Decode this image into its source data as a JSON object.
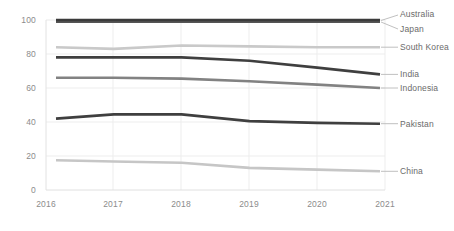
{
  "chart_data": {
    "type": "line",
    "title": "",
    "subtitle": "",
    "xlabel": "",
    "ylabel": "",
    "x": [
      2016,
      2017,
      2018,
      2019,
      2020,
      2021
    ],
    "xtick_labels": [
      "2016",
      "2017",
      "2018",
      "2019",
      "2020",
      "2021"
    ],
    "ytick_labels": [
      "0",
      "20",
      "40",
      "60",
      "80",
      "100"
    ],
    "yticks": [
      0,
      20,
      40,
      60,
      80,
      100
    ],
    "ylim": [
      0,
      100
    ],
    "xlim": [
      2016,
      2021
    ],
    "grid": true,
    "grid_color": "#e8e8e8",
    "legend_position": "right-inline-labels",
    "series": [
      {
        "name": "Australia",
        "values": [
          100,
          100,
          100,
          100,
          100,
          100
        ],
        "color": "#3b3b3b",
        "label": "Australia"
      },
      {
        "name": "Japan",
        "values": [
          99,
          99,
          99,
          99,
          99,
          99
        ],
        "color": "#555555",
        "label": "Japan"
      },
      {
        "name": "South Korea",
        "values": [
          84,
          83,
          85,
          84.5,
          84,
          84
        ],
        "color": "#c9c9c9",
        "label": "South Korea"
      },
      {
        "name": "India",
        "values": [
          78,
          78,
          78,
          76,
          72,
          68
        ],
        "color": "#3f3f3f",
        "label": "India"
      },
      {
        "name": "Indonesia",
        "values": [
          66,
          66,
          65.5,
          64,
          62,
          60
        ],
        "color": "#828282",
        "label": "Indonesia"
      },
      {
        "name": "Pakistan",
        "values": [
          42,
          44.5,
          44.5,
          40.5,
          39.5,
          39
        ],
        "color": "#3f3f3f",
        "label": "Pakistan"
      },
      {
        "name": "China",
        "values": [
          17.5,
          16.8,
          16,
          13,
          12,
          11
        ],
        "color": "#c6c6c6",
        "label": "China"
      }
    ]
  },
  "axis": {
    "y_labels": [
      "100",
      "80",
      "60",
      "40",
      "20",
      "0"
    ],
    "x_labels": [
      "2016",
      "2017",
      "2018",
      "2019",
      "2020",
      "2021"
    ]
  },
  "labels": {
    "australia": "Australia",
    "japan": "Japan",
    "south_korea": "South Korea",
    "india": "India",
    "indonesia": "Indonesia",
    "pakistan": "Pakistan",
    "china": "China"
  }
}
